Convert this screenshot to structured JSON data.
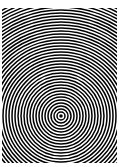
{
  "image": {
    "description": "Concentric black and white circles pattern (moiré)",
    "colors": {
      "ring": "#000000",
      "background": "#ffffff"
    },
    "center": {
      "x": 59,
      "y": 108
    },
    "ring_period_px": 3,
    "ring_count": 70
  }
}
